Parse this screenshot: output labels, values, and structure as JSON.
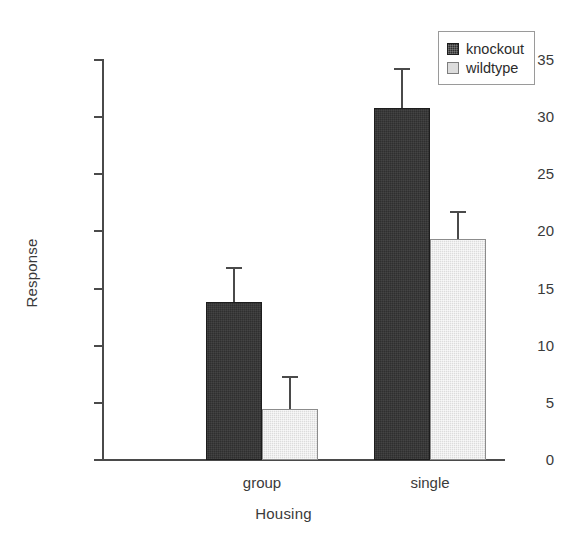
{
  "chart_data": {
    "type": "bar",
    "title": "",
    "xlabel": "Housing",
    "ylabel": "Response",
    "categories": [
      "group",
      "single"
    ],
    "series": [
      {
        "name": "knockout",
        "color": "#2f2f2f",
        "values": [
          13.8,
          30.8
        ],
        "errors_upper": [
          16.8,
          34.2
        ]
      },
      {
        "name": "wildtype",
        "color": "#dcdcdc",
        "values": [
          4.5,
          19.3
        ],
        "errors_upper": [
          7.3,
          21.7
        ]
      }
    ],
    "ylim": [
      0,
      35
    ],
    "yticks": [
      0,
      5,
      10,
      15,
      20,
      25,
      30,
      35
    ],
    "ytick_labels": [
      "0",
      "5",
      "10",
      "15",
      "20",
      "25",
      "30",
      "35"
    ],
    "grid": false,
    "legend_position": "top-right",
    "error_bar_style": "upper-only-with-cap"
  },
  "legend": {
    "items": [
      {
        "label": "knockout",
        "swatch": "knockout"
      },
      {
        "label": "wildtype",
        "swatch": "wildtype"
      }
    ]
  }
}
